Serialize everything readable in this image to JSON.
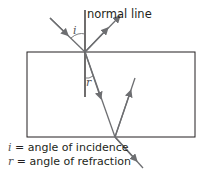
{
  "diagram": {
    "normal_label": "normal line",
    "angle_i_symbol": "i",
    "angle_r_symbol": "r",
    "legend": [
      {
        "symbol": "i",
        "text": "= angle of incidence"
      },
      {
        "symbol": "r",
        "text": "= angle of refraction"
      }
    ],
    "colors": {
      "ray": "#6d6e71",
      "block": "#231f20",
      "text": "#231f20"
    }
  }
}
